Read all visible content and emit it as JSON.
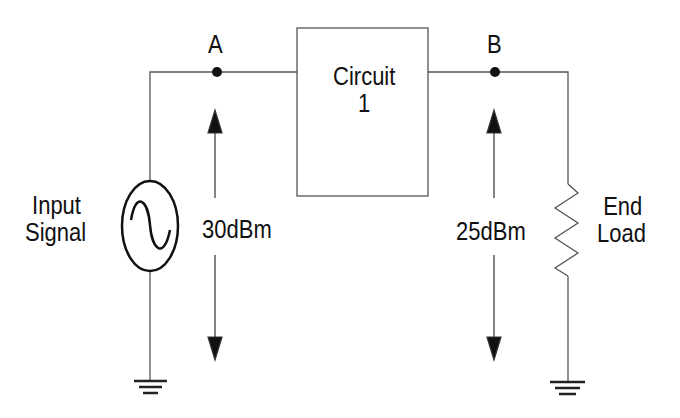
{
  "diagram": {
    "type": "circuit-schematic",
    "nodes": [
      {
        "id": "A",
        "label": "A"
      },
      {
        "id": "B",
        "label": "B"
      }
    ],
    "source": {
      "label_line1": "Input",
      "label_line2": "Signal",
      "symbol": "ac-source-icon"
    },
    "block": {
      "label_line1": "Circuit",
      "label_line2": "1"
    },
    "load": {
      "label_line1": "End",
      "label_line2": "Load",
      "symbol": "resistor-icon"
    },
    "measurements": [
      {
        "node": "A",
        "value": "30dBm"
      },
      {
        "node": "B",
        "value": "25dBm"
      }
    ],
    "colors": {
      "line": "#555555",
      "ink": "#111111",
      "background": "#ffffff"
    }
  }
}
